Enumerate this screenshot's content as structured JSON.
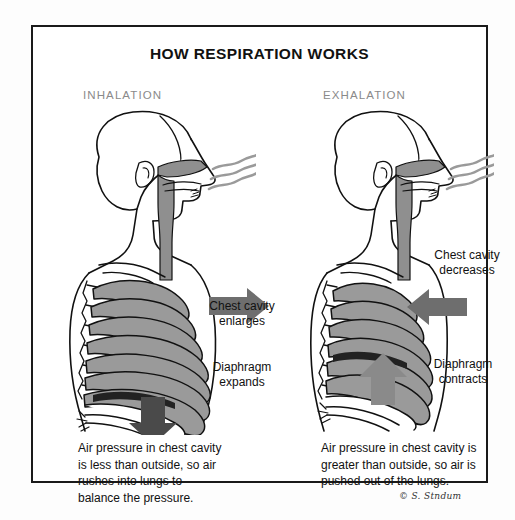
{
  "diagram": {
    "title": "HOW RESPIRATION WORKS",
    "signature": "© S. Stndum",
    "border_color": "#1a1a1a",
    "background_color": "#ffffff"
  },
  "panels": [
    {
      "id": "inhalation",
      "phase_label": "INHALATION",
      "arrow_direction": "right",
      "arrow_color": "#6e6e6e",
      "diaphragm_arrow_direction": "down",
      "diaphragm_arrow_color": "#4a4a4a",
      "annotations": {
        "chest": "Chest cavity\nenlarges",
        "diaphragm": "Diaphragm\nexpands"
      },
      "caption": "Air pressure in chest cavity\nis less than outside, so air\nrushes into lungs to\nbalance the pressure."
    },
    {
      "id": "exhalation",
      "phase_label": "EXHALATION",
      "arrow_direction": "left",
      "arrow_color": "#6e6e6e",
      "diaphragm_arrow_direction": "up",
      "diaphragm_arrow_color": "#8a8a8a",
      "annotations": {
        "chest": "Chest cavity\ndecreases",
        "diaphragm": "Diaphragm\ncontracts"
      },
      "caption": "Air pressure in chest cavity is\ngreater than outside, so air is\npushed out of the lungs."
    }
  ],
  "anatomy": {
    "airway_fill": "#8f8f8f",
    "rib_fill": "#9a9a9a",
    "outline_color": "#111111",
    "airflow_line_color": "#9a9a9a",
    "airflow_line_count": 3,
    "rib_count_inhalation": 11,
    "rib_count_exhalation": 11
  },
  "colors": {
    "text": "#111111",
    "phase_label": "#8a8a8a",
    "page_background": "#fdfdfd"
  }
}
